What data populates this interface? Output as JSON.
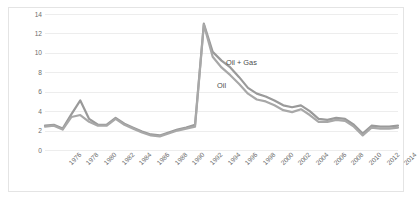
{
  "figure": {
    "border_color": "#e4e4e4",
    "background": "#ffffff"
  },
  "chart_data": {
    "type": "line",
    "title": "",
    "subtitle": "",
    "xlabel": "",
    "ylabel": "Production (MMbbl, MMboe)",
    "ylim": [
      0,
      14
    ],
    "ytick_values": [
      0,
      2,
      4,
      6,
      8,
      10,
      12,
      14
    ],
    "ytick_labels": [
      "0",
      "2",
      "4",
      "6",
      "8",
      "10",
      "12",
      "14"
    ],
    "grid": true,
    "grid_color": "#ededed",
    "grid_axis": "y",
    "xlim": [
      1975,
      2015
    ],
    "xtick_labels": [
      "1976",
      "1978",
      "1980",
      "1982",
      "1984",
      "1986",
      "1988",
      "1990",
      "1992",
      "1994",
      "1996",
      "1998",
      "2000",
      "2002",
      "2004",
      "2006",
      "2008",
      "2010",
      "2012",
      "2014"
    ],
    "xtick_values": [
      1976,
      1978,
      1980,
      1982,
      1984,
      1986,
      1988,
      1990,
      1992,
      1994,
      1996,
      1998,
      2000,
      2002,
      2004,
      2006,
      2008,
      2010,
      2012,
      2014
    ],
    "xtick_rotation": -45,
    "legend_position": "inline-annotations",
    "x": [
      1975,
      1976,
      1977,
      1978,
      1979,
      1980,
      1981,
      1982,
      1983,
      1984,
      1985,
      1986,
      1987,
      1988,
      1989,
      1990,
      1991,
      1992,
      1993,
      1994,
      1995,
      1996,
      1997,
      1998,
      1999,
      2000,
      2001,
      2002,
      2003,
      2004,
      2005,
      2006,
      2007,
      2008,
      2009,
      2010,
      2011,
      2012,
      2013,
      2014,
      2015
    ],
    "series": [
      {
        "name": "Oil + Gas",
        "label": "Oil + Gas",
        "color": "#9a9a9a",
        "line_width": 2.2,
        "values": [
          2.5,
          2.6,
          2.2,
          3.7,
          5.1,
          3.2,
          2.6,
          2.6,
          3.3,
          2.7,
          2.3,
          1.9,
          1.6,
          1.5,
          1.8,
          2.1,
          2.3,
          2.6,
          13.0,
          10.1,
          9.2,
          8.5,
          7.5,
          6.4,
          5.8,
          5.5,
          5.1,
          4.6,
          4.4,
          4.6,
          4.0,
          3.2,
          3.1,
          3.3,
          3.2,
          2.6,
          1.7,
          2.5,
          2.4,
          2.4,
          2.5
        ]
      },
      {
        "name": "Oil",
        "label": "Oil",
        "color": "#a8a8a8",
        "line_width": 2.2,
        "values": [
          2.4,
          2.5,
          2.1,
          3.4,
          3.6,
          2.9,
          2.5,
          2.5,
          3.2,
          2.6,
          2.2,
          1.8,
          1.5,
          1.4,
          1.7,
          2.0,
          2.2,
          2.4,
          12.9,
          9.6,
          8.5,
          7.7,
          6.8,
          5.8,
          5.2,
          5.0,
          4.6,
          4.1,
          3.9,
          4.2,
          3.6,
          2.9,
          2.9,
          3.1,
          3.0,
          2.4,
          1.5,
          2.3,
          2.2,
          2.2,
          2.3
        ]
      }
    ],
    "annotations": [
      {
        "text": "Oil + Gas",
        "x": 1995.5,
        "y": 9.0
      },
      {
        "text": "Oil",
        "x": 1994.5,
        "y": 6.6
      }
    ]
  }
}
